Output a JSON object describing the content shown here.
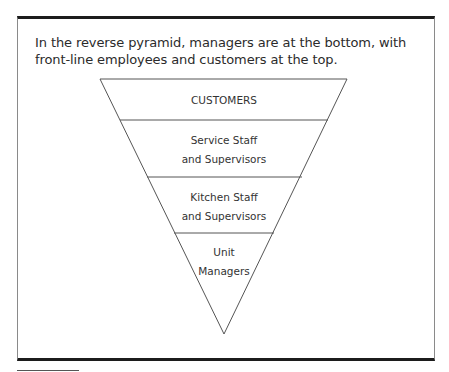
{
  "figure": {
    "caption": "In the reverse pyramid, managers are at the bottom, with front-line employees and customers at the top.",
    "diagram_type": "inverted pyramid",
    "tiers": [
      {
        "label_lines": [
          "CUSTOMERS"
        ]
      },
      {
        "label_lines": [
          "Service Staff",
          "and Supervisors"
        ]
      },
      {
        "label_lines": [
          "Kitchen Staff",
          "and Supervisors"
        ]
      },
      {
        "label_lines": [
          "Unit",
          "Managers"
        ]
      }
    ],
    "colors": {
      "frame_rule": "#1c1c1c",
      "frame_side": "#8a8a8a",
      "pyramid_stroke": "#555555",
      "text": "#2b2b2b"
    }
  }
}
